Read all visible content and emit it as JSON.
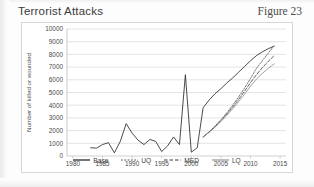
{
  "header": {
    "title": "Terrorist Attacks",
    "figure_label": "Figure 23"
  },
  "chart_data": {
    "type": "line",
    "title": "Terrorist Attacks",
    "xlabel": "",
    "ylabel": "Number of killed or wounded",
    "xlim": [
      1979,
      2016
    ],
    "ylim": [
      0,
      10000
    ],
    "ytick_step": 1000,
    "yticks": [
      "0",
      "1000",
      "2000",
      "3000",
      "4000",
      "5000",
      "6000",
      "7000",
      "8000",
      "9000",
      "10000"
    ],
    "xticks": [
      "1980",
      "1985",
      "1990",
      "1995",
      "2000",
      "2005",
      "2010",
      "2015"
    ],
    "grid": "horizontal",
    "legend_position": "bottom-center",
    "colors": {
      "base": "#2b2b2b",
      "uq": "#555555",
      "med": "#3a3a3a",
      "lq": "#8a8a8a",
      "gridline": "#d9d9d9",
      "axis": "#bdbdbd",
      "text": "#4a4a4a",
      "frame": "#d8d8d8"
    },
    "series": [
      {
        "name": "Base",
        "style": "solid",
        "x": [
          1983,
          1984,
          1985,
          1986,
          1987,
          1988,
          1989,
          1990,
          1991,
          1992,
          1993,
          1994,
          1995,
          1996,
          1997,
          1998,
          1999,
          2000,
          2001,
          2002,
          2003,
          2004,
          2005,
          2006,
          2007,
          2008,
          2009,
          2010,
          2011,
          2012,
          2013,
          2014
        ],
        "values": [
          650,
          620,
          900,
          1050,
          250,
          1150,
          2550,
          1800,
          1250,
          900,
          1300,
          1150,
          350,
          800,
          1500,
          900,
          6400,
          300,
          650,
          3800,
          4400,
          4900,
          5300,
          5750,
          6150,
          6600,
          7050,
          7500,
          7900,
          8200,
          8450,
          8650
        ]
      },
      {
        "name": "UQ",
        "style": "dotted",
        "x": [
          2002,
          2003,
          2004,
          2005,
          2006,
          2007,
          2008,
          2009,
          2010,
          2011,
          2012,
          2013,
          2014
        ],
        "values": [
          1500,
          1900,
          2350,
          2850,
          3400,
          4000,
          4650,
          5350,
          6100,
          6900,
          7500,
          8100,
          8700
        ]
      },
      {
        "name": "MED",
        "style": "dashed",
        "x": [
          2002,
          2003,
          2004,
          2005,
          2006,
          2007,
          2008,
          2009,
          2010,
          2011,
          2012,
          2013,
          2014
        ],
        "values": [
          1500,
          1880,
          2300,
          2780,
          3300,
          3860,
          4460,
          5100,
          5780,
          6400,
          6950,
          7450,
          7900
        ]
      },
      {
        "name": "LQ",
        "style": "solid-light",
        "x": [
          2002,
          2003,
          2004,
          2005,
          2006,
          2007,
          2008,
          2009,
          2010,
          2011,
          2012,
          2013,
          2014
        ],
        "values": [
          1500,
          1860,
          2260,
          2710,
          3200,
          3720,
          4280,
          4870,
          5490,
          6050,
          6500,
          6900,
          7250
        ]
      }
    ],
    "history_spikes": [
      {
        "year": 1987,
        "value": 2550
      },
      {
        "year": 1995,
        "value": 6400
      },
      {
        "year": 1998,
        "value": 6400
      },
      {
        "year": 2001,
        "value": 3800
      }
    ]
  },
  "legend": {
    "items": [
      {
        "label": "Base",
        "style": "solid"
      },
      {
        "label": "UQ",
        "style": "dotted"
      },
      {
        "label": "MED",
        "style": "dashed"
      },
      {
        "label": "LQ",
        "style": "solid-light"
      }
    ]
  }
}
